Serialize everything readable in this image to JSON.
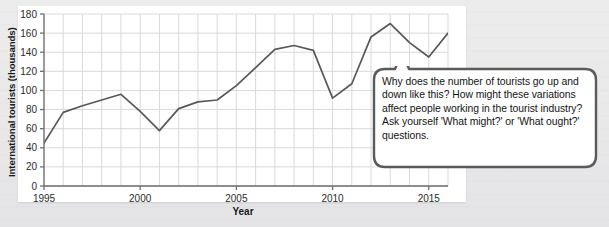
{
  "chart_data": {
    "type": "line",
    "title": "",
    "xlabel": "Year",
    "ylabel": "International tourists (thousands)",
    "xlim": [
      1995,
      2016
    ],
    "ylim": [
      0,
      180
    ],
    "ytick_step": 20,
    "yticks": [
      0,
      20,
      40,
      60,
      80,
      100,
      120,
      140,
      160,
      180
    ],
    "xticks": [
      1995,
      2000,
      2005,
      2010,
      2015
    ],
    "xtick_labels": [
      "1995",
      "2000",
      "2005",
      "2010",
      "2015"
    ],
    "ytick_labels": [
      "0",
      "20",
      "40",
      "60",
      "80",
      "100",
      "120",
      "140",
      "160",
      "180"
    ],
    "grid": true,
    "legend": "none",
    "line_color": "#58585a",
    "x": [
      1995,
      1996,
      1997,
      1998,
      1999,
      2000,
      2001,
      2002,
      2003,
      2004,
      2005,
      2006,
      2007,
      2008,
      2009,
      2010,
      2011,
      2012,
      2013,
      2014,
      2015,
      2016
    ],
    "values": [
      45,
      77,
      84,
      90,
      96,
      78,
      58,
      81,
      88,
      90,
      105,
      124,
      143,
      147,
      142,
      92,
      107,
      156,
      170,
      150,
      135,
      160
    ],
    "series": [
      {
        "name": "International tourists (thousands)",
        "values": [
          45,
          77,
          84,
          90,
          96,
          78,
          58,
          81,
          88,
          90,
          105,
          124,
          143,
          147,
          142,
          92,
          107,
          156,
          170,
          150,
          135,
          160
        ]
      }
    ]
  },
  "callout": {
    "text": "Why does the number of tourists go up and down like this? How might these variations affect people working in the tourist industry? Ask yourself 'What might?' or 'What ought?' questions.",
    "border_color": "#5a5a5c",
    "background": "#ffffff"
  },
  "colors": {
    "page_background": "#e9e9ea",
    "panel_background": "#ffffff",
    "grid": "#d9d9de",
    "axis": "#6f6f72",
    "text": "#1a1a1a"
  }
}
